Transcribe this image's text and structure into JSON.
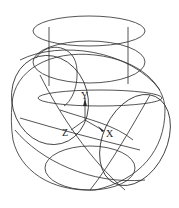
{
  "diagram": {
    "type": "3d-wireframe",
    "axes": {
      "y_label": "Y",
      "z_label": "Z",
      "x_label": "X"
    },
    "colors": {
      "line": "#2a2a2a",
      "background": "#ffffff"
    }
  }
}
